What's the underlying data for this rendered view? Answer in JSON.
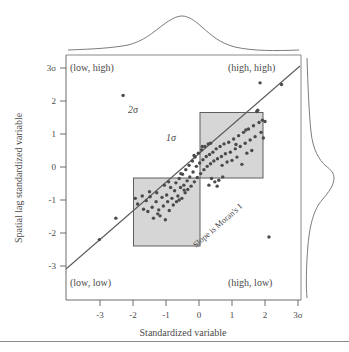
{
  "figure": {
    "name": "moran-scatterplot",
    "axes": {
      "x_title": "Standardized variable",
      "y_title": "Spatial lag standardized variable",
      "x_ticks": [
        "-3",
        "-2",
        "-1",
        "0",
        "1",
        "2",
        "3σ"
      ],
      "y_ticks": [
        "3σ",
        "2",
        "1",
        "0",
        "-1",
        "-2",
        "-3"
      ]
    },
    "quadrant_labels": {
      "top_left": "(low, high)",
      "top_right": "(high, high)",
      "bottom_left": "(low, low)",
      "bottom_right": "(high, low)"
    },
    "annotations": {
      "sigma2": "2σ",
      "sigma1": "1σ",
      "slope": "Slope is Moran's I"
    },
    "colors": {
      "box_fill": "#cfcfcf",
      "box_stroke": "#5e5e5e",
      "point": "#4a4a4a",
      "line": "#5b5b5b",
      "axis": "#6d6d6d",
      "text": "#4a4a4a"
    }
  },
  "chart_data": {
    "type": "scatter",
    "title": "",
    "xlabel": "Standardized variable",
    "ylabel": "Spatial lag standardized variable",
    "xlim": [
      -3.5,
      3.2
    ],
    "ylim": [
      -3.4,
      3.2
    ],
    "xticks": [
      -3,
      -2,
      -1,
      0,
      1,
      2,
      3
    ],
    "xticklabels": [
      "-3",
      "-2",
      "-1",
      "0",
      "1",
      "2",
      "3σ"
    ],
    "yticks": [
      3,
      2,
      1,
      0,
      -1,
      -2,
      -3
    ],
    "yticklabels": [
      "3σ",
      "2",
      "1",
      "0",
      "-1",
      "-2",
      "-3"
    ],
    "grid": false,
    "legend": null,
    "regression_line": {
      "label": "Slope is Moran's I",
      "slope": 0.78,
      "intercept": 0.0,
      "x_start": -3.5,
      "x_end": 3.15
    },
    "shaded_regions": [
      {
        "name": "1-sigma-low-box",
        "x0": -1.95,
        "y0": -1.95,
        "x1": 0.0,
        "y1": 0.0
      },
      {
        "name": "1-sigma-high-box",
        "x0": 0.0,
        "y0": 0.0,
        "x1": 1.85,
        "y1": 1.9
      }
    ],
    "quadrant_annotations": [
      {
        "text": "(low, high)",
        "x": -3.1,
        "y": 2.95
      },
      {
        "text": "(high, high)",
        "x": 1.15,
        "y": 2.95
      },
      {
        "text": "(low, low)",
        "x": -3.1,
        "y": -3.0
      },
      {
        "text": "(high, low)",
        "x": 1.15,
        "y": -3.0
      },
      {
        "text": "2σ",
        "x": -2.0,
        "y": 1.78
      },
      {
        "text": "1σ",
        "x": -0.85,
        "y": 0.95
      }
    ],
    "marginal_densities": {
      "top": {
        "type": "kde",
        "peak_x": 0.0,
        "spread": 1.0
      },
      "right": {
        "type": "kde",
        "peak_y": 0.0,
        "spread": 1.0
      }
    },
    "points": [
      [
        -3.02,
        -2.2
      ],
      [
        -2.52,
        -1.55
      ],
      [
        -2.3,
        2.17
      ],
      [
        1.85,
        2.55
      ],
      [
        2.5,
        2.5
      ],
      [
        2.12,
        -2.12
      ],
      [
        -1.93,
        -0.95
      ],
      [
        -1.86,
        -1.12
      ],
      [
        -1.72,
        -0.88
      ],
      [
        -1.68,
        -1.28
      ],
      [
        -1.6,
        -1.02
      ],
      [
        -1.55,
        -1.35
      ],
      [
        -1.48,
        -0.9
      ],
      [
        -1.42,
        -1.22
      ],
      [
        -1.38,
        -1.55
      ],
      [
        -1.3,
        -1.05
      ],
      [
        -1.28,
        -0.78
      ],
      [
        -1.22,
        -1.3
      ],
      [
        -1.18,
        -1.48
      ],
      [
        -1.12,
        -0.92
      ],
      [
        -1.08,
        -1.18
      ],
      [
        -1.02,
        -1.6
      ],
      [
        -0.98,
        -0.85
      ],
      [
        -0.95,
        -1.05
      ],
      [
        -0.9,
        -1.32
      ],
      [
        -0.86,
        -0.62
      ],
      [
        -0.82,
        -0.95
      ],
      [
        -0.78,
        -1.15
      ],
      [
        -0.74,
        -0.72
      ],
      [
        -0.7,
        -0.48
      ],
      [
        -0.68,
        -1.05
      ],
      [
        -0.64,
        -0.88
      ],
      [
        -0.6,
        -0.35
      ],
      [
        -0.56,
        -0.62
      ],
      [
        -0.52,
        -0.95
      ],
      [
        -0.5,
        -0.22
      ],
      [
        -0.46,
        -0.55
      ],
      [
        -0.42,
        -0.78
      ],
      [
        -0.4,
        -0.08
      ],
      [
        -0.36,
        -0.42
      ],
      [
        -0.34,
        -0.68
      ],
      [
        -0.3,
        0.05
      ],
      [
        -0.28,
        -0.3
      ],
      [
        -0.24,
        -0.58
      ],
      [
        -0.2,
        0.18
      ],
      [
        -0.18,
        -0.15
      ],
      [
        -0.14,
        -0.45
      ],
      [
        -0.12,
        0.3
      ],
      [
        -0.08,
        0.02
      ],
      [
        -0.05,
        -0.32
      ],
      [
        -0.02,
        0.42
      ],
      [
        0.02,
        0.12
      ],
      [
        0.05,
        -0.2
      ],
      [
        0.08,
        0.52
      ],
      [
        0.12,
        0.22
      ],
      [
        0.15,
        -0.08
      ],
      [
        0.18,
        0.62
      ],
      [
        0.22,
        0.32
      ],
      [
        0.25,
        0.02
      ],
      [
        0.28,
        0.7
      ],
      [
        0.32,
        0.38
      ],
      [
        0.35,
        0.1
      ],
      [
        0.38,
        -0.35
      ],
      [
        0.42,
        0.45
      ],
      [
        0.45,
        0.18
      ],
      [
        0.48,
        -0.45
      ],
      [
        0.52,
        0.55
      ],
      [
        0.56,
        0.25
      ],
      [
        0.6,
        -0.4
      ],
      [
        0.64,
        0.62
      ],
      [
        0.68,
        0.32
      ],
      [
        0.72,
        -0.3
      ],
      [
        0.76,
        0.7
      ],
      [
        0.8,
        0.4
      ],
      [
        0.85,
        0.15
      ],
      [
        0.9,
        0.75
      ],
      [
        0.95,
        0.45
      ],
      [
        1.0,
        0.2
      ],
      [
        1.05,
        0.85
      ],
      [
        1.1,
        0.55
      ],
      [
        1.15,
        0.3
      ],
      [
        1.2,
        0.95
      ],
      [
        1.25,
        0.62
      ],
      [
        1.3,
        0.08
      ],
      [
        1.35,
        1.05
      ],
      [
        1.4,
        0.72
      ],
      [
        1.45,
        0.42
      ],
      [
        1.5,
        1.15
      ],
      [
        1.55,
        0.82
      ],
      [
        1.6,
        0.5
      ],
      [
        1.65,
        1.25
      ],
      [
        1.7,
        0.92
      ],
      [
        1.75,
        1.68
      ],
      [
        1.78,
        1.72
      ],
      [
        1.82,
        1.35
      ],
      [
        1.88,
        1.05
      ],
      [
        1.92,
        1.42
      ],
      [
        1.95,
        0.88
      ],
      [
        2.0,
        1.38
      ],
      [
        -1.5,
        -0.75
      ],
      [
        -1.25,
        -1.42
      ],
      [
        -0.6,
        -1.0
      ],
      [
        -0.45,
        -0.7
      ],
      [
        0.3,
        -0.55
      ],
      [
        0.55,
        -0.58
      ],
      [
        0.7,
        0.05
      ],
      [
        1.12,
        0.68
      ],
      [
        1.42,
        1.12
      ],
      [
        -0.92,
        -0.45
      ],
      [
        -0.15,
        0.35
      ],
      [
        0.1,
        0.62
      ],
      [
        0.35,
        0.72
      ],
      [
        -0.55,
        -0.2
      ],
      [
        -1.05,
        -0.55
      ]
    ]
  }
}
